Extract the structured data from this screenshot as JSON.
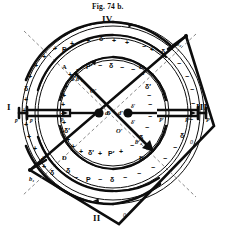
{
  "figure": {
    "caption": "Fig. 74 b.",
    "quadrants": {
      "top": "IV",
      "right": "III",
      "bottom": "II",
      "left": "I"
    },
    "zeros": {
      "right": "0",
      "bottom": "0"
    },
    "colors": {
      "ink": "#0d0d0d",
      "paper": "#ffffff",
      "dash": "#6a6a6a"
    }
  },
  "outer_ring": {
    "label": "outer-commutator-ring",
    "markings": [
      {
        "text": "+",
        "x": 86,
        "y": 37
      },
      {
        "text": "δ",
        "x": 99,
        "y": 35
      },
      {
        "text": "+",
        "x": 112,
        "y": 37
      },
      {
        "text": "+",
        "x": 125,
        "y": 39
      },
      {
        "text": "+",
        "x": 70,
        "y": 40
      },
      {
        "text": "P",
        "x": 62,
        "y": 46
      },
      {
        "text": "+",
        "x": 53,
        "y": 45
      },
      {
        "text": "+",
        "x": 42,
        "y": 53
      },
      {
        "text": "+",
        "x": 34,
        "y": 62
      },
      {
        "text": "+",
        "x": 28,
        "y": 73
      },
      {
        "text": "δ",
        "x": 24,
        "y": 85
      },
      {
        "text": "+",
        "x": 24,
        "y": 96
      },
      {
        "text": "+",
        "x": 22,
        "y": 107
      },
      {
        "text": "+",
        "x": 24,
        "y": 121
      },
      {
        "text": "+",
        "x": 27,
        "y": 133
      },
      {
        "text": "+",
        "x": 33,
        "y": 145
      },
      {
        "text": "+",
        "x": 41,
        "y": 155
      },
      {
        "text": "+",
        "x": 42,
        "y": 163
      },
      {
        "text": "δ",
        "x": 50,
        "y": 169
      },
      {
        "text": "−",
        "x": 142,
        "y": 43
      },
      {
        "text": "+",
        "x": 150,
        "y": 46
      },
      {
        "text": "δ",
        "x": 161,
        "y": 48
      },
      {
        "text": "−",
        "x": 177,
        "y": 60
      },
      {
        "text": "−",
        "x": 185,
        "y": 73
      },
      {
        "text": "−",
        "x": 190,
        "y": 86
      },
      {
        "text": "−",
        "x": 191,
        "y": 100
      },
      {
        "text": "−",
        "x": 189,
        "y": 116
      },
      {
        "text": "δ",
        "x": 180,
        "y": 132
      },
      {
        "text": "−",
        "x": 173,
        "y": 144
      },
      {
        "text": "−",
        "x": 163,
        "y": 155
      },
      {
        "text": "−",
        "x": 151,
        "y": 164
      },
      {
        "text": "−",
        "x": 137,
        "y": 170
      },
      {
        "text": "−",
        "x": 123,
        "y": 174
      },
      {
        "text": "δ",
        "x": 110,
        "y": 176
      },
      {
        "text": "−",
        "x": 98,
        "y": 176
      },
      {
        "text": "P",
        "x": 86,
        "y": 176
      },
      {
        "text": "−",
        "x": 74,
        "y": 174
      },
      {
        "text": "δ",
        "x": 66,
        "y": 167
      }
    ]
  },
  "inner_ring": {
    "label": "inner-armature-ring",
    "markings": [
      {
        "text": "−",
        "x": 76,
        "y": 66
      },
      {
        "text": "P′",
        "x": 86,
        "y": 63
      },
      {
        "text": "−",
        "x": 98,
        "y": 62
      },
      {
        "text": "δ",
        "x": 109,
        "y": 62
      },
      {
        "text": "−",
        "x": 120,
        "y": 64
      },
      {
        "text": "−",
        "x": 131,
        "y": 66
      },
      {
        "text": "−",
        "x": 140,
        "y": 71
      },
      {
        "text": "δ′",
        "x": 145,
        "y": 83
      },
      {
        "text": "−",
        "x": 147,
        "y": 92
      },
      {
        "text": "−",
        "x": 148,
        "y": 101
      },
      {
        "text": "−",
        "x": 148,
        "y": 113
      },
      {
        "text": "−",
        "x": 145,
        "y": 124
      },
      {
        "text": "δ",
        "x": 139,
        "y": 134
      },
      {
        "text": "−",
        "x": 130,
        "y": 142
      },
      {
        "text": "+",
        "x": 119,
        "y": 148
      },
      {
        "text": "P′",
        "x": 108,
        "y": 150
      },
      {
        "text": "+",
        "x": 98,
        "y": 150
      },
      {
        "text": "δ′",
        "x": 88,
        "y": 149
      },
      {
        "text": "+",
        "x": 79,
        "y": 148
      },
      {
        "text": "+",
        "x": 71,
        "y": 143
      },
      {
        "text": "+",
        "x": 66,
        "y": 136
      },
      {
        "text": "δ′",
        "x": 64,
        "y": 127
      },
      {
        "text": "+",
        "x": 62,
        "y": 119
      },
      {
        "text": "+",
        "x": 61,
        "y": 110
      },
      {
        "text": "+",
        "x": 61,
        "y": 101
      },
      {
        "text": "+",
        "x": 62,
        "y": 92
      },
      {
        "text": "+",
        "x": 64,
        "y": 83
      },
      {
        "text": "δ′",
        "x": 70,
        "y": 75
      },
      {
        "text": "+",
        "x": 68,
        "y": 71
      }
    ]
  },
  "points": {
    "A": "A",
    "B": "B",
    "D": "D",
    "E": "E",
    "O": "0",
    "O_upper": "O′",
    "O_lower": "O′",
    "b1": "b₁",
    "b2": "b₂",
    "b1_prime": "b′₁",
    "b2_prime": "b′₂",
    "d": "d",
    "d_prime": "d′"
  },
  "brush_labels": {
    "left_outer": "p",
    "left_inner": "p",
    "left_mid": "P",
    "left_brush_P": "P",
    "right_inner": "P′",
    "right_outer": "P′",
    "right_mid": "P′",
    "delta_left": "δ",
    "delta_right": "δ",
    "delta_prime_left": "δ′",
    "delta_prime_right": "δ′"
  },
  "chart_data": {
    "type": "diagram",
    "title": "Fig. 74 b.",
    "geometry": {
      "center": [
        113,
        113
      ],
      "outer_ring_radii": [
        90,
        87
      ],
      "mid_ring_radii": [
        77,
        74
      ],
      "inner_ring_radii": [
        55,
        52
      ],
      "diamond_vertices": [
        [
          113,
          224
        ],
        [
          201,
          131
        ],
        [
          186,
          36
        ],
        [
          30,
          170
        ]
      ],
      "brush_axis_y": 113,
      "diagonal_from": [
        75,
        73
      ],
      "diagonal_to": [
        152,
        150
      ]
    }
  }
}
